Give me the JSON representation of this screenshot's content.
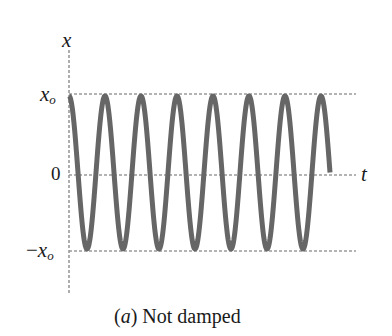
{
  "chart_data": {
    "type": "line",
    "title": "",
    "caption": {
      "prefix": "(",
      "letter": "a",
      "suffix": ")",
      "text": "Not damped"
    },
    "xlabel": "t",
    "ylabel": "x",
    "y_ticks": [
      {
        "label_main": "x",
        "label_sub": "o",
        "value": 1,
        "sign": ""
      },
      {
        "label_main": "0",
        "label_sub": "",
        "value": 0,
        "sign": ""
      },
      {
        "label_main": "x",
        "label_sub": "o",
        "value": -1,
        "sign": "−"
      }
    ],
    "ylim": [
      -1.55,
      1.75
    ],
    "grid": "dashed horizontal reference lines at x_o, 0, -x_o",
    "series": [
      {
        "name": "x(t) = x_o cos(ωt)",
        "function": "cosine",
        "amplitude": 1,
        "cycles": 7.25,
        "start_phase": "peak at t=0",
        "end": "ends at zero crossing after 8th peak",
        "color": "#666666"
      }
    ],
    "colors": {
      "curve": "#666666",
      "axes": "#9a9a9a",
      "text": "#1a1a1a"
    }
  }
}
